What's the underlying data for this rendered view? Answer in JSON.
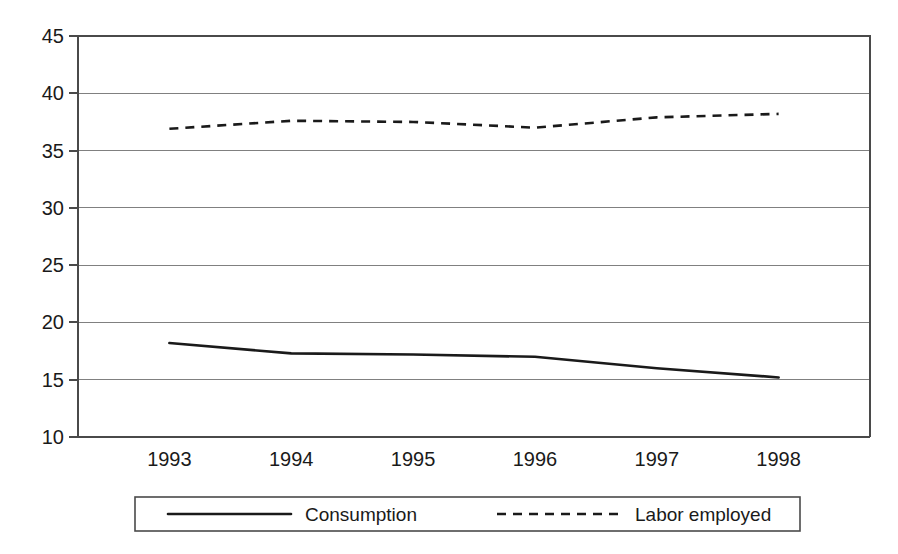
{
  "chart_data": {
    "type": "line",
    "title": "",
    "subtitle": "",
    "xlabel": "",
    "ylabel": "",
    "categories": [
      "1993",
      "1994",
      "1995",
      "1996",
      "1997",
      "1998"
    ],
    "x": [
      1993,
      1994,
      1995,
      1996,
      1997,
      1998
    ],
    "series": [
      {
        "name": "Consumption",
        "style": "solid",
        "color": "#1a1a1a",
        "values": [
          18.2,
          17.3,
          17.2,
          17.0,
          16.0,
          15.2
        ]
      },
      {
        "name": "Labor employed",
        "style": "dashed",
        "color": "#1a1a1a",
        "values": [
          36.9,
          37.6,
          37.5,
          37.0,
          37.9,
          38.2
        ]
      }
    ],
    "ylim": [
      10,
      45
    ],
    "yticks": [
      10,
      15,
      20,
      25,
      30,
      35,
      40,
      45
    ],
    "ytick_labels": [
      "10",
      "15",
      "20",
      "25",
      "30",
      "35",
      "40",
      "45"
    ],
    "xtick_labels": [
      "1993",
      "1994",
      "1995",
      "1996",
      "1997",
      "1998"
    ],
    "grid": true,
    "grid_axis": "y",
    "legend_position": "bottom",
    "legend_entries": [
      {
        "label": "Consumption",
        "style": "solid"
      },
      {
        "label": "Labor employed",
        "style": "dashed"
      }
    ],
    "colors": {
      "grid": "#808080",
      "axis": "#4a4a4a",
      "line": "#1a1a1a",
      "background": "#ffffff"
    }
  }
}
